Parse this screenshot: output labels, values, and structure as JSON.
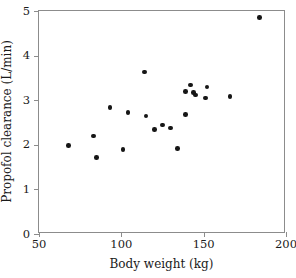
{
  "chart_data": {
    "type": "scatter",
    "title": "",
    "xlabel": "Body weight (kg)",
    "ylabel": "Propofol clearance (L/min)",
    "xlim": [
      50,
      200
    ],
    "ylim": [
      0,
      5
    ],
    "xticks": [
      50,
      100,
      150,
      200
    ],
    "yticks": [
      0,
      1,
      2,
      3,
      4,
      5
    ],
    "xtick_labels": [
      "50",
      "100",
      "150",
      "200"
    ],
    "ytick_labels": [
      "0",
      "1",
      "2",
      "3",
      "4",
      "5"
    ],
    "grid": false,
    "legend": null,
    "marker": "filled-circle",
    "marker_color": "#161616",
    "frame_color": "#8c8c8c",
    "points": [
      {
        "x": 68,
        "y": 1.99
      },
      {
        "x": 83,
        "y": 2.2
      },
      {
        "x": 85,
        "y": 1.72
      },
      {
        "x": 93,
        "y": 2.84
      },
      {
        "x": 101,
        "y": 1.9
      },
      {
        "x": 104,
        "y": 2.72
      },
      {
        "x": 114,
        "y": 3.63
      },
      {
        "x": 115,
        "y": 2.65
      },
      {
        "x": 120,
        "y": 2.34
      },
      {
        "x": 125,
        "y": 2.44
      },
      {
        "x": 130,
        "y": 2.38
      },
      {
        "x": 134,
        "y": 1.92
      },
      {
        "x": 139,
        "y": 2.68
      },
      {
        "x": 139,
        "y": 3.2
      },
      {
        "x": 142,
        "y": 3.34
      },
      {
        "x": 144,
        "y": 3.17
      },
      {
        "x": 145,
        "y": 3.12
      },
      {
        "x": 151,
        "y": 3.05
      },
      {
        "x": 152,
        "y": 3.3
      },
      {
        "x": 166,
        "y": 3.08
      },
      {
        "x": 184,
        "y": 4.85
      }
    ]
  }
}
